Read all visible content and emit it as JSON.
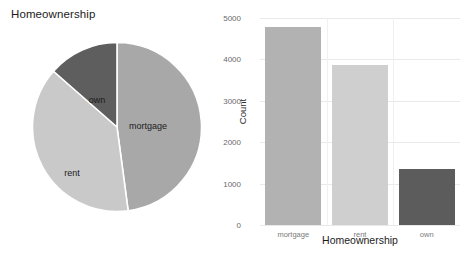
{
  "chart_data": [
    {
      "type": "pie",
      "title": "Homeownership",
      "categories": [
        "mortgage",
        "rent",
        "own"
      ],
      "values": [
        4789,
        3858,
        1353
      ],
      "percentages": [
        47.9,
        38.6,
        13.5
      ],
      "slice_colors": [
        "#a8a8a8",
        "#c9c9c9",
        "#5e5e5e"
      ],
      "slice_gap_color": "#ffffff",
      "start_angle_deg": 0,
      "direction": "clockwise",
      "labels_inside": true,
      "legend": "none",
      "xlabel": "",
      "ylabel": ""
    },
    {
      "type": "bar",
      "title": "",
      "categories": [
        "mortgage",
        "rent",
        "own"
      ],
      "values": [
        4789,
        3858,
        1353
      ],
      "bar_colors": [
        "#b2b2b2",
        "#cfcfcf",
        "#5c5c5c"
      ],
      "xlabel": "Homeownership",
      "ylabel": "Count",
      "ylim": [
        0,
        5000
      ],
      "yticks": [
        0,
        1000,
        2000,
        3000,
        4000,
        5000
      ],
      "ytick_labels": [
        "0",
        "1000",
        "2000",
        "3000",
        "4000",
        "5000"
      ],
      "grid": true,
      "grid_color": "#e9e9e9",
      "legend": "none"
    }
  ],
  "pie": {
    "title": "Homeownership",
    "slices": [
      {
        "label": "mortgage",
        "value": 4789,
        "percent": 47.9,
        "color": "#a8a8a8"
      },
      {
        "label": "rent",
        "value": 3858,
        "percent": 38.6,
        "color": "#c9c9c9"
      },
      {
        "label": "own",
        "value": 1353,
        "percent": 13.5,
        "color": "#5e5e5e"
      }
    ]
  },
  "bar": {
    "ylabel": "Count",
    "xlabel": "Homeownership",
    "ytick_labels": [
      "5000",
      "4000",
      "3000",
      "2000",
      "1000",
      "0"
    ],
    "bars": [
      {
        "label": "mortgage",
        "value": 4789,
        "color": "#b2b2b2"
      },
      {
        "label": "rent",
        "value": 3858,
        "color": "#cfcfcf"
      },
      {
        "label": "own",
        "value": 1353,
        "color": "#5c5c5c"
      }
    ]
  }
}
